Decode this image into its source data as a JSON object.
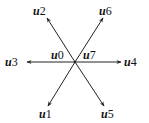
{
  "diagram": {
    "center": {
      "x": 75,
      "y": 62
    },
    "stroke_color": "#222222",
    "vectors": [
      {
        "name": "u1",
        "prefix": "u",
        "index": "1",
        "x2": 48,
        "y2": 106
      },
      {
        "name": "u2",
        "prefix": "u",
        "index": "2",
        "x2": 47,
        "y2": 18
      },
      {
        "name": "u3",
        "prefix": "u",
        "index": "3",
        "x2": 27,
        "y2": 62
      },
      {
        "name": "u4",
        "prefix": "u",
        "index": "4",
        "x2": 121,
        "y2": 62
      },
      {
        "name": "u5",
        "prefix": "u",
        "index": "5",
        "x2": 104,
        "y2": 106
      },
      {
        "name": "u6",
        "prefix": "u",
        "index": "6",
        "x2": 103,
        "y2": 18
      }
    ],
    "zero_vectors": [
      {
        "name": "u0",
        "prefix": "u",
        "index": "0"
      },
      {
        "name": "u7",
        "prefix": "u",
        "index": "7"
      }
    ]
  }
}
